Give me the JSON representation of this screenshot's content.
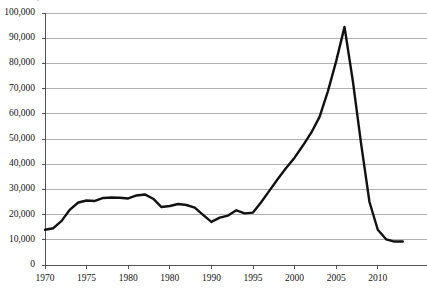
{
  "chart_data": {
    "type": "line",
    "title": "",
    "xlabel": "",
    "ylabel": "",
    "xlim": [
      1969,
      2013.5
    ],
    "ylim": [
      0,
      100000
    ],
    "grid": true,
    "grid_axis": "y",
    "legend": "none",
    "series_color": "#111111",
    "grid_color": "#b0b0b0",
    "axis_color": "#6f6f6f",
    "ytick_values": [
      0,
      10000,
      20000,
      30000,
      40000,
      50000,
      60000,
      70000,
      80000,
      90000,
      100000
    ],
    "ytick_labels": [
      "0",
      "10,000",
      "20,000",
      "30,000",
      "40,000",
      "50,000",
      "60,000",
      "70,000",
      "80,000",
      "90,000",
      "100,000"
    ],
    "xtick_values": [
      1970,
      1975,
      1980,
      1985,
      1990,
      1995,
      2000,
      2005,
      2010
    ],
    "xtick_labels": [
      "1970",
      "1975",
      "1980",
      "1980",
      "1990",
      "1995",
      "2000",
      "2005",
      "2010"
    ],
    "x": [
      1970,
      1971,
      1972,
      1973,
      1974,
      1975,
      1976,
      1977,
      1978,
      1979,
      1980,
      1981,
      1982,
      1983,
      1984,
      1985,
      1986,
      1987,
      1988,
      1989,
      1990,
      1991,
      1992,
      1993,
      1994,
      1995,
      1996,
      1997,
      1998,
      1999,
      2000,
      2001,
      2002,
      2003,
      2004,
      2005,
      2006,
      2007,
      2008,
      2009,
      2010,
      2011,
      2012,
      2013
    ],
    "values": [
      14000,
      14600,
      17500,
      22000,
      24800,
      25600,
      25400,
      26600,
      26800,
      26700,
      26400,
      27600,
      28000,
      26300,
      23000,
      23400,
      24200,
      23800,
      22800,
      19900,
      17100,
      18800,
      19600,
      21700,
      20500,
      20800,
      25000,
      29600,
      34200,
      38600,
      42600,
      47400,
      52500,
      58800,
      68900,
      80900,
      94500,
      73000,
      48000,
      25000,
      14000,
      10200,
      9300,
      9300
    ],
    "series_name": "",
    "annotations": []
  },
  "axes": {
    "ytick_labels": [
      "100,000",
      "90,000",
      "80,000",
      "70,000",
      "60,000",
      "50,000",
      "40,000",
      "30,000",
      "20,000",
      "10,000",
      "0"
    ],
    "xtick_labels": [
      "1970",
      "1975",
      "1980",
      "1980",
      "1990",
      "1995",
      "2000",
      "2005",
      "2010"
    ]
  },
  "title_remnant": "·"
}
